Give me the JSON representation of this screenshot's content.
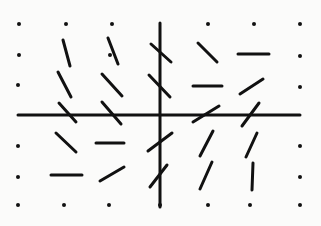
{
  "diagram": {
    "type": "slope-field",
    "background": "#fbfbfa",
    "ink": "#111111",
    "axes": {
      "x_axis": {
        "x1": 18,
        "y1": 115,
        "x2": 300,
        "y2": 115
      },
      "y_axis": {
        "x1": 160,
        "y1": 23,
        "x2": 160,
        "y2": 207
      }
    },
    "grid": {
      "columns_x": [
        19,
        66,
        112,
        160,
        208,
        254,
        300
      ],
      "rows_y": [
        24,
        56,
        87,
        117,
        146,
        177,
        205
      ]
    },
    "dots": [
      [
        19,
        24
      ],
      [
        66,
        24
      ],
      [
        112,
        24
      ],
      [
        208,
        24
      ],
      [
        254,
        24
      ],
      [
        300,
        24
      ],
      [
        19,
        55
      ],
      [
        110,
        55
      ],
      [
        300,
        56
      ],
      [
        18,
        85
      ],
      [
        300,
        87
      ],
      [
        18,
        146
      ],
      [
        300,
        146
      ],
      [
        18,
        177
      ],
      [
        300,
        177
      ],
      [
        18,
        205
      ],
      [
        64,
        205
      ],
      [
        109,
        205
      ],
      [
        160,
        205
      ],
      [
        208,
        205
      ],
      [
        250,
        205
      ],
      [
        300,
        205
      ]
    ],
    "segments": [
      {
        "x1": 63,
        "y1": 40,
        "x2": 70,
        "y2": 66
      },
      {
        "x1": 108,
        "y1": 38,
        "x2": 118,
        "y2": 64
      },
      {
        "x1": 151,
        "y1": 44,
        "x2": 171,
        "y2": 62
      },
      {
        "x1": 198,
        "y1": 43,
        "x2": 217,
        "y2": 62
      },
      {
        "x1": 238,
        "y1": 54,
        "x2": 269,
        "y2": 54
      },
      {
        "x1": 58,
        "y1": 72,
        "x2": 71,
        "y2": 97
      },
      {
        "x1": 102,
        "y1": 74,
        "x2": 122,
        "y2": 96
      },
      {
        "x1": 149,
        "y1": 75,
        "x2": 170,
        "y2": 97
      },
      {
        "x1": 193,
        "y1": 86,
        "x2": 222,
        "y2": 86
      },
      {
        "x1": 240,
        "y1": 94,
        "x2": 263,
        "y2": 79
      },
      {
        "x1": 59,
        "y1": 103,
        "x2": 76,
        "y2": 122
      },
      {
        "x1": 102,
        "y1": 102,
        "x2": 121,
        "y2": 124
      },
      {
        "x1": 193,
        "y1": 122,
        "x2": 219,
        "y2": 106
      },
      {
        "x1": 242,
        "y1": 126,
        "x2": 259,
        "y2": 103
      },
      {
        "x1": 56,
        "y1": 133,
        "x2": 76,
        "y2": 152
      },
      {
        "x1": 96,
        "y1": 143,
        "x2": 124,
        "y2": 143
      },
      {
        "x1": 148,
        "y1": 151,
        "x2": 172,
        "y2": 133
      },
      {
        "x1": 200,
        "y1": 156,
        "x2": 213,
        "y2": 131
      },
      {
        "x1": 246,
        "y1": 157,
        "x2": 257,
        "y2": 133
      },
      {
        "x1": 51,
        "y1": 175,
        "x2": 82,
        "y2": 175
      },
      {
        "x1": 100,
        "y1": 181,
        "x2": 124,
        "y2": 167
      },
      {
        "x1": 150,
        "y1": 187,
        "x2": 167,
        "y2": 165
      },
      {
        "x1": 200,
        "y1": 189,
        "x2": 212,
        "y2": 162
      },
      {
        "x1": 252,
        "y1": 190,
        "x2": 253,
        "y2": 163
      }
    ]
  }
}
